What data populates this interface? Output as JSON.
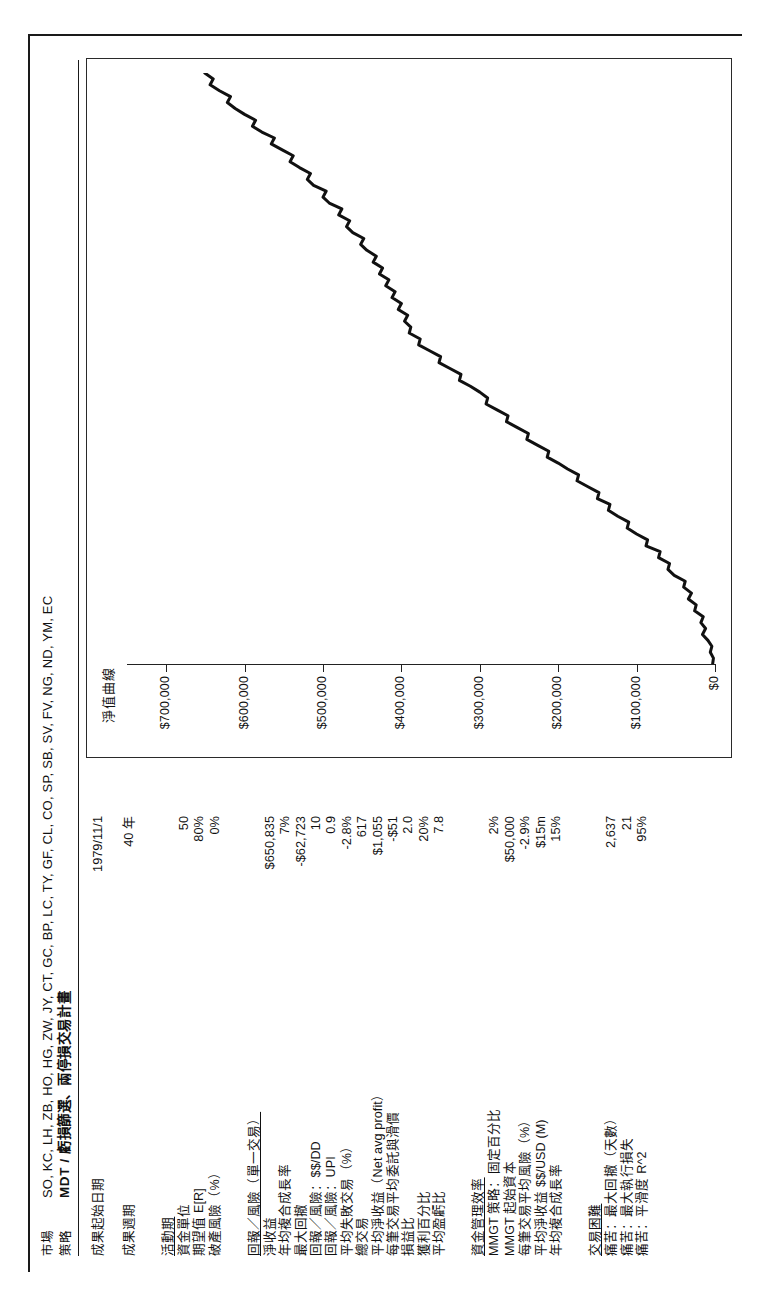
{
  "header": {
    "market_label": "市場",
    "market_value": "SO, KC, LH, ZB, HO, HG, ZW, JY, CT, GC, BP, LC, TY, GF, CL, CO, SP, SB, SV, FV, NG, ND, YM, EC",
    "strategy_label": "策略",
    "strategy_value": "MDT / 虧損篩選、兩停損交易計畫"
  },
  "summary": {
    "rows": [
      {
        "label": "成果起始日期",
        "value": "1979/11/1"
      },
      {
        "label": "成果週期",
        "value": "40 年"
      }
    ]
  },
  "position_sizing": {
    "rows": [
      {
        "label": "活動期",
        "value": "",
        "head": true
      },
      {
        "label": "資金單位",
        "value": "50"
      },
      {
        "label": "期望值 E[R]",
        "value": "80%"
      },
      {
        "label": "破產風險（%）",
        "value": "0%"
      }
    ]
  },
  "reward_risk": {
    "title": "回報／風險（單一交易）",
    "rows": [
      {
        "label": "淨收益",
        "value": "$650,835"
      },
      {
        "label": "年均複合成長率",
        "value": "7%"
      },
      {
        "label": "最大回撤",
        "value": "-$62,723"
      },
      {
        "label": "回報／風險：$$/DD",
        "value": "10"
      },
      {
        "label": "回報／風險：UPI",
        "value": "0.9"
      },
      {
        "label": "平均失敗交易（%）",
        "value": "-2.8%"
      },
      {
        "label": "總交易",
        "value": "617"
      },
      {
        "label": "平均淨收益（Net avg profit）",
        "value": "$1,055"
      },
      {
        "label": "每筆交易平均委託與滑價",
        "value": "-$51"
      },
      {
        "label": "損益比",
        "value": "2.0"
      },
      {
        "label": "獲利百分比",
        "value": "20%"
      },
      {
        "label": "平均盈虧比",
        "value": "7.8"
      }
    ]
  },
  "money_mgmt": {
    "title": "資金管理效率",
    "rows": [
      {
        "label": "MMGT 策略：固定百分比",
        "value": "2%"
      },
      {
        "label": "MMGT 起始資本",
        "value": "$50,000"
      },
      {
        "label": "每筆交易平均風險（%）",
        "value": "-2.9%"
      },
      {
        "label": "平均淨收益 $$/USD (M)",
        "value": "$15m"
      },
      {
        "label": "年均複合成長率",
        "value": "15%"
      }
    ]
  },
  "difficulty": {
    "title": "交易困難",
    "rows": [
      {
        "label": "痛苦：最大回撤（天數）",
        "value": "2,637"
      },
      {
        "label": "痛苦：最大執行損失",
        "value": "21"
      },
      {
        "label": "痛苦：平滑度 R^2",
        "value": "95%"
      }
    ]
  },
  "chart_data": {
    "type": "line",
    "title": "淨值曲線",
    "xlabel": "",
    "ylabel": "",
    "ylim": [
      0,
      750000
    ],
    "grid": false,
    "legend": "none",
    "yticks": [
      0,
      100000,
      200000,
      300000,
      400000,
      500000,
      600000,
      700000
    ],
    "ytick_labels": [
      "$0",
      "$100,000",
      "$200,000",
      "$300,000",
      "$400,000",
      "$500,000",
      "$600,000",
      "$700,000"
    ],
    "series": [
      {
        "name": "Equity",
        "x": [
          0,
          1,
          2,
          3,
          4,
          5,
          6,
          7,
          8,
          9,
          10,
          11,
          12,
          13,
          14,
          15,
          16,
          17,
          18,
          19,
          20,
          21,
          22,
          23,
          24,
          25,
          26,
          27,
          28,
          29,
          30,
          31,
          32,
          33,
          34,
          35,
          36,
          37,
          38,
          39,
          40,
          41,
          42,
          43,
          44,
          45,
          46,
          47,
          48,
          49,
          50,
          51,
          52,
          53,
          54,
          55,
          56,
          57,
          58,
          59,
          60,
          61,
          62,
          63,
          64,
          65,
          66,
          67,
          68,
          69,
          70,
          71,
          72,
          73,
          74,
          75,
          76,
          77,
          78,
          79,
          80,
          81,
          82,
          83,
          84,
          85,
          86,
          87,
          88,
          89,
          90,
          91,
          92,
          93,
          94,
          95,
          96,
          97,
          98,
          99,
          100
        ],
        "values": [
          3000,
          2000,
          6000,
          4000,
          9000,
          16000,
          12000,
          18000,
          15000,
          26000,
          24000,
          34000,
          30000,
          40000,
          38000,
          52000,
          60000,
          58000,
          72000,
          70000,
          88000,
          86000,
          100000,
          112000,
          110000,
          124000,
          136000,
          134000,
          150000,
          148000,
          162000,
          176000,
          174000,
          188000,
          200000,
          214000,
          212000,
          226000,
          240000,
          238000,
          252000,
          266000,
          264000,
          278000,
          292000,
          290000,
          300000,
          312000,
          326000,
          324000,
          338000,
          352000,
          350000,
          364000,
          378000,
          376000,
          390000,
          388000,
          396000,
          392000,
          404000,
          400000,
          412000,
          408000,
          420000,
          416000,
          428000,
          424000,
          436000,
          432000,
          444000,
          452000,
          448000,
          462000,
          470000,
          466000,
          480000,
          476000,
          492000,
          500000,
          496000,
          512000,
          520000,
          516000,
          530000,
          542000,
          538000,
          552000,
          566000,
          562000,
          578000,
          590000,
          586000,
          600000,
          612000,
          622000,
          618000,
          632000,
          644000,
          640000,
          650835
        ]
      }
    ]
  }
}
